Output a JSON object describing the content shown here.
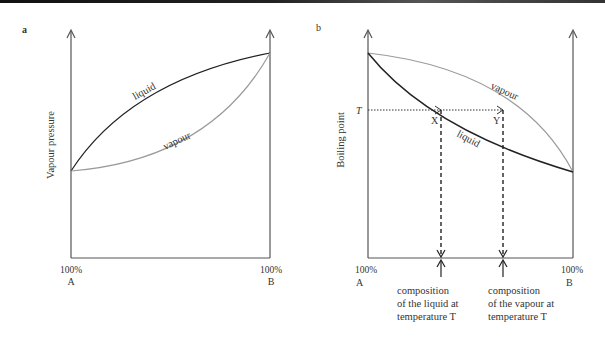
{
  "panels": [
    {
      "label": "a",
      "y_axis_label": "Vapour pressure",
      "x_left_tick": "100%",
      "x_left_label": "A",
      "x_right_tick": "100%",
      "x_right_label": "B",
      "curve_labels": {
        "liquid": "liquid",
        "vapour": "vapour"
      }
    },
    {
      "label": "b",
      "y_axis_label": "Boiling point",
      "x_left_tick": "100%",
      "x_left_label": "A",
      "x_right_tick": "100%",
      "x_right_label": "B",
      "curve_labels": {
        "liquid": "liquid",
        "vapour": "vapour"
      },
      "temperature_label": "T",
      "point_x_label": "X",
      "point_y_label": "Y",
      "annotation_liquid": [
        "composition",
        "of the liquid at",
        "temperature T"
      ],
      "annotation_vapour": [
        "composition",
        "of the vapour at",
        "temperature T"
      ]
    }
  ],
  "colors": {
    "liquid_curve": "#222222",
    "vapour_curve": "#9a9a9a",
    "axis": "#555555"
  }
}
